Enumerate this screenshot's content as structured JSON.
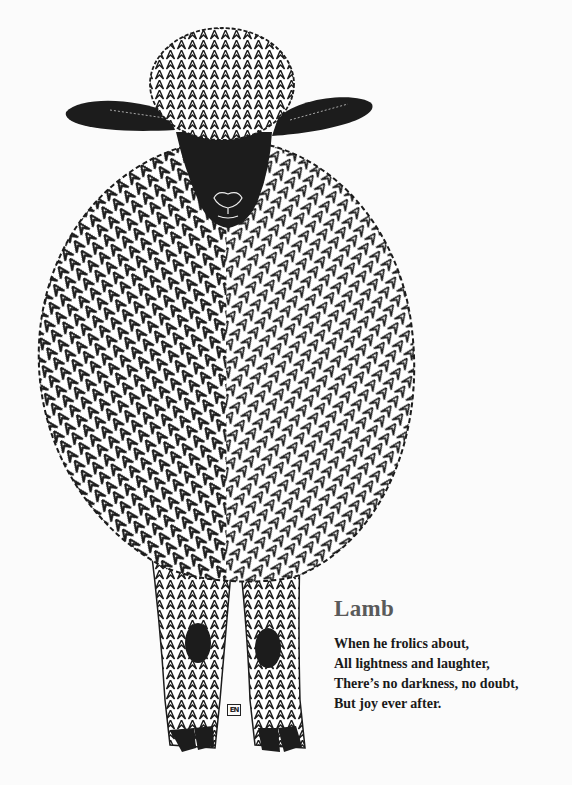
{
  "page": {
    "background": "#fbfbfb"
  },
  "illustration": {
    "subject": "sheep-woodcut",
    "ink_color": "#1c1c1c",
    "monogram": "EN"
  },
  "poem": {
    "title": "Lamb",
    "title_color": "#5a5a5a",
    "lines": [
      "When he frolics about,",
      "All lightness and laughter,",
      "There’s no darkness, no doubt,",
      "But joy ever after."
    ]
  }
}
